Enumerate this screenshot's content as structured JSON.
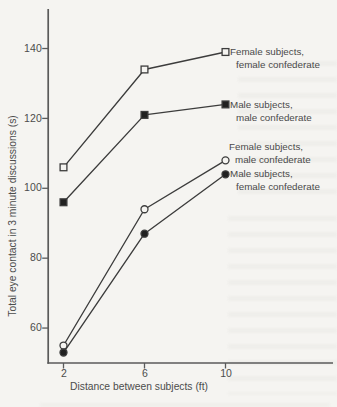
{
  "figure": {
    "background": "#f5f4f1",
    "ink": "#3c3c3c",
    "axis_color": "#5a5a5a"
  },
  "chart_data": {
    "type": "line",
    "x": [
      2,
      6,
      10
    ],
    "x_ticks": [
      "2",
      "6",
      "10"
    ],
    "y_ticks": [
      "60",
      "80",
      "100",
      "120",
      "140"
    ],
    "y_tick_values": [
      60,
      80,
      100,
      120,
      140
    ],
    "xlabel": "Distance between subjects (ft)",
    "ylabel": "Total eye contact in 3 minute discussions (s)",
    "xlim": [
      1.2,
      15.3
    ],
    "ylim": [
      50,
      151.5
    ],
    "grid": false,
    "legend_position": "right-of-last-point",
    "series": [
      {
        "name": "Female subjects, female confederate",
        "label_lines": [
          "Female subjects,",
          "female confederate"
        ],
        "marker": "open-square",
        "values": [
          106,
          134,
          139
        ]
      },
      {
        "name": "Male subjects, male confederate",
        "label_lines": [
          "Male subjects,",
          "male confederate"
        ],
        "marker": "filled-square",
        "values": [
          96,
          121,
          124
        ]
      },
      {
        "name": "Female subjects, male confederate",
        "label_lines": [
          "Female subjects,",
          "male confederate"
        ],
        "marker": "open-circle",
        "values": [
          55,
          94,
          108
        ]
      },
      {
        "name": "Male subjects, female confederate",
        "label_lines": [
          "Male subjects,",
          "female confederate"
        ],
        "marker": "filled-circle",
        "values": [
          53,
          87,
          104
        ]
      }
    ]
  }
}
